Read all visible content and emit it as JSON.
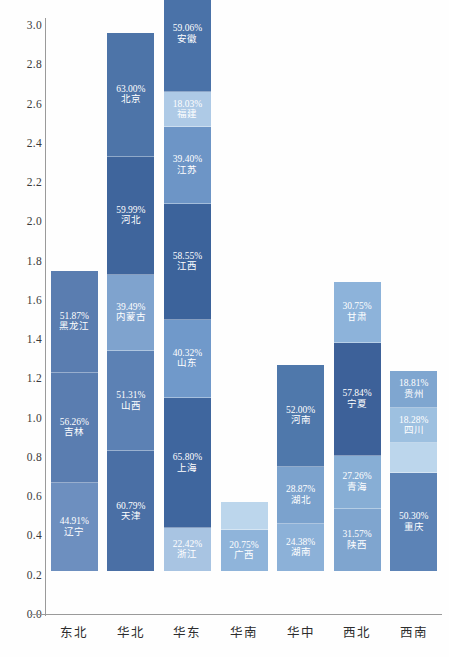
{
  "chart_data": {
    "type": "bar",
    "subtype": "stacked-bar",
    "title": "",
    "xlabel": "",
    "ylabel": "",
    "ylim": [
      0.0,
      3.0
    ],
    "ytick_step": 0.2,
    "ytick_labels": [
      "0.0",
      "0.2",
      "0.4",
      "0.6",
      "0.8",
      "1.0",
      "1.2",
      "1.4",
      "1.6",
      "1.8",
      "2.0",
      "2.2",
      "2.4",
      "2.6",
      "2.8",
      "3.0"
    ],
    "grid": false,
    "legend": "none",
    "value_unit": "percent",
    "categories": [
      "东北",
      "华北",
      "华东",
      "华南",
      "华中",
      "西北",
      "西南"
    ],
    "totals": [
      1.53,
      2.75,
      3.03,
      0.35,
      1.06,
      1.47,
      1.02
    ],
    "stacks": [
      {
        "category": "东北",
        "total": 1.53,
        "segments": [
          {
            "name": "辽宁",
            "label": "44.91%",
            "value": 44.91,
            "height": 0.45,
            "color": "#6d8fbf"
          },
          {
            "name": "吉林",
            "label": "56.26%",
            "value": 56.26,
            "height": 0.56,
            "color": "#5a7db0"
          },
          {
            "name": "黑龙江",
            "label": "51.87%",
            "value": 51.87,
            "height": 0.52,
            "color": "#5a7db0"
          }
        ]
      },
      {
        "category": "华北",
        "total": 2.75,
        "segments": [
          {
            "name": "天津",
            "label": "60.79%",
            "value": 60.79,
            "height": 0.61,
            "color": "#4a6fa5"
          },
          {
            "name": "山西",
            "label": "51.31%",
            "value": 51.31,
            "height": 0.51,
            "color": "#5c81b4"
          },
          {
            "name": "内蒙古",
            "label": "39.49%",
            "value": 39.49,
            "height": 0.39,
            "color": "#7fa3ce"
          },
          {
            "name": "河北",
            "label": "59.99%",
            "value": 59.99,
            "height": 0.6,
            "color": "#3f659c"
          },
          {
            "name": "北京",
            "label": "63.00%",
            "value": 63.0,
            "height": 0.63,
            "color": "#4d74a8"
          }
        ]
      },
      {
        "category": "华东",
        "total": 3.03,
        "segments": [
          {
            "name": "浙江",
            "label": "22.42%",
            "value": 22.42,
            "height": 0.22,
            "color": "#a8c4e2"
          },
          {
            "name": "上海",
            "label": "65.80%",
            "value": 65.8,
            "height": 0.66,
            "color": "#3f669e"
          },
          {
            "name": "山东",
            "label": "40.32%",
            "value": 40.32,
            "height": 0.4,
            "color": "#7099ca"
          },
          {
            "name": "江西",
            "label": "58.55%",
            "value": 58.55,
            "height": 0.59,
            "color": "#3c639b"
          },
          {
            "name": "江苏",
            "label": "39.40%",
            "value": 39.4,
            "height": 0.39,
            "color": "#6d95c6"
          },
          {
            "name": "福建",
            "label": "18.03%",
            "value": 18.03,
            "height": 0.18,
            "color": "#aecae6"
          },
          {
            "name": "安徽",
            "label": "59.06%",
            "value": 59.06,
            "height": 0.59,
            "color": "#4a72a8"
          }
        ]
      },
      {
        "category": "华南",
        "total": 0.35,
        "segments": [
          {
            "name": "广西",
            "label": "20.75%",
            "value": 20.75,
            "height": 0.21,
            "color": "#8fb4da"
          },
          {
            "name": "",
            "label": "",
            "value": null,
            "height": 0.14,
            "color": "#bcd6ec"
          }
        ]
      },
      {
        "category": "华中",
        "total": 1.06,
        "segments": [
          {
            "name": "湖南",
            "label": "24.38%",
            "value": 24.38,
            "height": 0.24,
            "color": "#8cb1d8"
          },
          {
            "name": "湖北",
            "label": "28.87%",
            "value": 28.87,
            "height": 0.29,
            "color": "#7ba2cd"
          },
          {
            "name": "河南",
            "label": "52.00%",
            "value": 52.0,
            "height": 0.52,
            "color": "#4f78ab"
          }
        ]
      },
      {
        "category": "西北",
        "total": 1.47,
        "segments": [
          {
            "name": "陕西",
            "label": "31.57%",
            "value": 31.57,
            "height": 0.32,
            "color": "#7fa5cf"
          },
          {
            "name": "青海",
            "label": "27.26%",
            "value": 27.26,
            "height": 0.27,
            "color": "#87aed5"
          },
          {
            "name": "宁夏",
            "label": "57.84%",
            "value": 57.84,
            "height": 0.58,
            "color": "#3d6199"
          },
          {
            "name": "甘肃",
            "label": "30.75%",
            "value": 30.75,
            "height": 0.31,
            "color": "#8db3da"
          }
        ]
      },
      {
        "category": "西南",
        "total": 1.02,
        "segments": [
          {
            "name": "重庆",
            "label": "50.30%",
            "value": 50.3,
            "height": 0.5,
            "color": "#5c83b6"
          },
          {
            "name": "",
            "label": "",
            "value": null,
            "height": 0.15,
            "color": "#bcd6ec"
          },
          {
            "name": "四川",
            "label": "18.28%",
            "value": 18.28,
            "height": 0.18,
            "color": "#9dc0e0"
          },
          {
            "name": "贵州",
            "label": "18.81%",
            "value": 18.81,
            "height": 0.19,
            "color": "#7fa6d0"
          }
        ]
      }
    ]
  },
  "axis": {
    "y_line_color": "#9a9a9a",
    "x_line_color": "#9a9a9a",
    "tick_text_color": "#3a3a3a"
  },
  "background": "#ffffff"
}
